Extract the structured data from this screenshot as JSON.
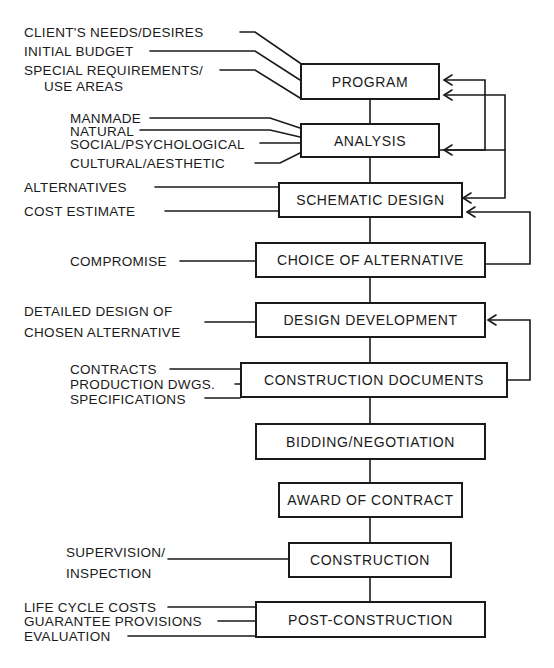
{
  "diagram": {
    "type": "flowchart",
    "stages": [
      {
        "id": "program",
        "label": "PROGRAM",
        "inputs": [
          "CLIENT'S NEEDS/DESIRES",
          "INITIAL BUDGET",
          "SPECIAL REQUIREMENTS/",
          "USE AREAS"
        ]
      },
      {
        "id": "analysis",
        "label": "ANALYSIS",
        "inputs": [
          "MANMADE",
          "NATURAL",
          "SOCIAL/PSYCHOLOGICAL",
          "CULTURAL/AESTHETIC"
        ]
      },
      {
        "id": "schematic",
        "label": "SCHEMATIC DESIGN",
        "inputs": [
          "ALTERNATIVES",
          "COST ESTIMATE"
        ]
      },
      {
        "id": "choice",
        "label": "CHOICE OF ALTERNATIVE",
        "inputs": [
          "COMPROMISE"
        ]
      },
      {
        "id": "design_dev",
        "label": "DESIGN DEVELOPMENT",
        "inputs": [
          "DETAILED DESIGN OF",
          "CHOSEN ALTERNATIVE"
        ]
      },
      {
        "id": "construction_docs",
        "label": "CONSTRUCTION DOCUMENTS",
        "inputs": [
          "CONTRACTS",
          "PRODUCTION DWGS.",
          "SPECIFICATIONS"
        ]
      },
      {
        "id": "bidding",
        "label": "BIDDING/NEGOTIATION",
        "inputs": []
      },
      {
        "id": "award",
        "label": "AWARD OF CONTRACT",
        "inputs": []
      },
      {
        "id": "construction",
        "label": "CONSTRUCTION",
        "inputs": [
          "SUPERVISION/",
          "INSPECTION"
        ]
      },
      {
        "id": "post_construction",
        "label": "POST-CONSTRUCTION",
        "inputs": [
          "LIFE CYCLE COSTS",
          "GUARANTEE PROVISIONS",
          "EVALUATION"
        ]
      }
    ],
    "feedback_loops": [
      {
        "from": "analysis",
        "to": "program"
      },
      {
        "from": "schematic",
        "to": "program"
      },
      {
        "from": "schematic",
        "to": "analysis"
      },
      {
        "from": "choice",
        "to": "schematic"
      },
      {
        "from": "construction_docs",
        "to": "design_dev"
      }
    ],
    "colors": {
      "ink": "#1a1a1a",
      "background": "#ffffff"
    }
  }
}
